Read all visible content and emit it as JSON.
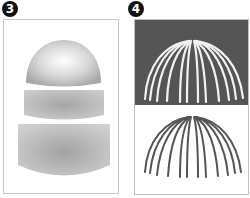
{
  "figure": {
    "panels": [
      {
        "label": "3",
        "description": "Exploded sphere-dome assembly: hemisphere cap, middle band, bottom cylinder",
        "parts": [
          "hemisphere-cap",
          "middle-band",
          "bottom-cylinder"
        ]
      },
      {
        "label": "4",
        "description": "Dome wireframe ribs shown in white on dark background and dark on white background",
        "views": [
          {
            "name": "dark-background",
            "rib_color": "#f2f2f2",
            "background": "#555555"
          },
          {
            "name": "light-background",
            "rib_color": "#555555",
            "background": "#ffffff"
          }
        ],
        "rib_count": 12
      }
    ]
  }
}
